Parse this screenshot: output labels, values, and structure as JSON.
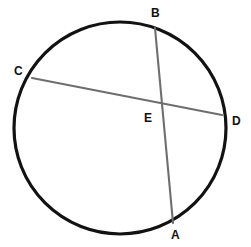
{
  "figure": {
    "kind": "circle-with-two-intersecting-chords",
    "background_color": "#ffffff",
    "circle": {
      "name": "circle-outline",
      "cx": 120,
      "cy": 128,
      "r": 106,
      "stroke_color": "#121212",
      "stroke_width": 3.2
    },
    "chords": [
      {
        "name": "chord-ba",
        "from_label": "B",
        "to_label": "A",
        "x1": 155,
        "y1": 28,
        "x2": 173,
        "y2": 223,
        "stroke_color": "#6e6e6e",
        "stroke_width": 2.1
      },
      {
        "name": "chord-cd",
        "from_label": "C",
        "to_label": "D",
        "x1": 32,
        "y1": 78,
        "x2": 222,
        "y2": 115,
        "stroke_color": "#6e6e6e",
        "stroke_width": 2.1
      }
    ],
    "intersection": {
      "name": "point-e",
      "label": "E",
      "x": 161,
      "y": 105
    },
    "labels": {
      "a": "A",
      "b": "B",
      "c": "C",
      "d": "D",
      "e": "E"
    },
    "label_color": "#111111",
    "label_font_size": "12px"
  }
}
